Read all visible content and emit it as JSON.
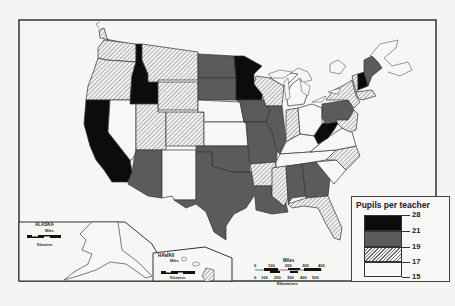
{
  "map": {
    "title": "Pupils per teacher",
    "region": "United States",
    "colors": {
      "black": "#0c0c0c",
      "dark_gray": "#5b5b5b",
      "hatched": "hatch",
      "white": "#f7f7f5",
      "border": "#333333",
      "background": "#f4f4f2"
    }
  },
  "legend": {
    "title": "Pupils per teacher",
    "breaks": [
      "28",
      "21",
      "19",
      "17",
      "15"
    ],
    "classes": [
      {
        "range": "21–28",
        "fill": "black"
      },
      {
        "range": "19–21",
        "fill": "dark_gray"
      },
      {
        "range": "17–19",
        "fill": "hatched"
      },
      {
        "range": "15–17",
        "fill": "white"
      }
    ]
  },
  "insets": {
    "alaska": {
      "label": "ALASKA",
      "scale_miles_label": "Miles",
      "scale_miles_ticks": [
        "0",
        "100",
        "200",
        "300"
      ],
      "scale_km_ticks": [
        "0",
        "100",
        "200",
        "300",
        "400",
        "500"
      ],
      "scale_km_label": "Kilometres"
    },
    "hawaii": {
      "label": "HAWAII",
      "scale_miles_label": "Miles",
      "scale_miles_ticks": [
        "0",
        "100",
        "200"
      ],
      "scale_km_ticks": [
        "0",
        "100",
        "200"
      ],
      "scale_km_label": "Kilometres"
    }
  },
  "scale_bar": {
    "miles_label": "Miles",
    "miles_ticks": [
      "0",
      "100",
      "200",
      "300",
      "400"
    ],
    "km_ticks": [
      "0",
      "100",
      "200",
      "300",
      "400",
      "500"
    ],
    "km_label": "Kilometres"
  },
  "states": [
    {
      "name": "Washington",
      "class": "hatched"
    },
    {
      "name": "Oregon",
      "class": "hatched"
    },
    {
      "name": "California",
      "class": "black"
    },
    {
      "name": "Idaho",
      "class": "black"
    },
    {
      "name": "Nevada",
      "class": "white"
    },
    {
      "name": "Montana",
      "class": "hatched"
    },
    {
      "name": "Wyoming",
      "class": "hatched"
    },
    {
      "name": "Utah",
      "class": "hatched"
    },
    {
      "name": "Arizona",
      "class": "dark_gray"
    },
    {
      "name": "Colorado",
      "class": "hatched"
    },
    {
      "name": "New Mexico",
      "class": "white"
    },
    {
      "name": "North Dakota",
      "class": "dark_gray"
    },
    {
      "name": "South Dakota",
      "class": "dark_gray"
    },
    {
      "name": "Nebraska",
      "class": "white"
    },
    {
      "name": "Kansas",
      "class": "white"
    },
    {
      "name": "Oklahoma",
      "class": "dark_gray"
    },
    {
      "name": "Texas",
      "class": "dark_gray"
    },
    {
      "name": "Minnesota",
      "class": "black"
    },
    {
      "name": "Iowa",
      "class": "dark_gray"
    },
    {
      "name": "Missouri",
      "class": "dark_gray"
    },
    {
      "name": "Arkansas",
      "class": "hatched"
    },
    {
      "name": "Louisiana",
      "class": "dark_gray"
    },
    {
      "name": "Wisconsin",
      "class": "hatched"
    },
    {
      "name": "Illinois",
      "class": "dark_gray"
    },
    {
      "name": "Michigan",
      "class": "white"
    },
    {
      "name": "Indiana",
      "class": "hatched"
    },
    {
      "name": "Ohio",
      "class": "white"
    },
    {
      "name": "Kentucky",
      "class": "white"
    },
    {
      "name": "Tennessee",
      "class": "white"
    },
    {
      "name": "Mississippi",
      "class": "hatched"
    },
    {
      "name": "Alabama",
      "class": "dark_gray"
    },
    {
      "name": "Georgia",
      "class": "dark_gray"
    },
    {
      "name": "Florida",
      "class": "hatched"
    },
    {
      "name": "South Carolina",
      "class": "white"
    },
    {
      "name": "North Carolina",
      "class": "hatched"
    },
    {
      "name": "Virginia",
      "class": "white"
    },
    {
      "name": "West Virginia",
      "class": "black"
    },
    {
      "name": "Pennsylvania",
      "class": "dark_gray"
    },
    {
      "name": "New York",
      "class": "hatched"
    },
    {
      "name": "Vermont",
      "class": "hatched"
    },
    {
      "name": "New Hampshire",
      "class": "black"
    },
    {
      "name": "Maine",
      "class": "dark_gray"
    },
    {
      "name": "Alaska",
      "class": "white"
    },
    {
      "name": "Hawaii",
      "class": "hatched"
    }
  ]
}
